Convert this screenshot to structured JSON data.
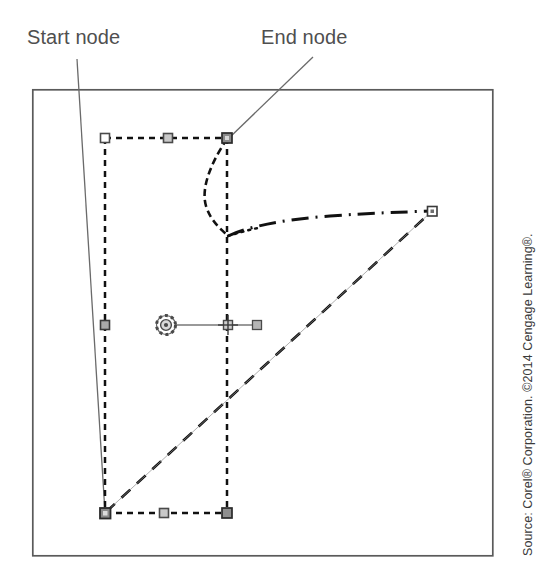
{
  "figure": {
    "canvas": {
      "width": 547,
      "height": 582,
      "background": "#ffffff"
    },
    "frame": {
      "name": "illustration-frame",
      "x": 32,
      "y": 89,
      "width": 461,
      "height": 467,
      "stroke": "#5a5a5a",
      "stroke_width": 1.6
    },
    "annotations": [
      {
        "id": "start-node",
        "label": "Start node",
        "label_x": 27,
        "label_y": 27,
        "leader": {
          "x1": 77,
          "y1": 59,
          "x2": 105,
          "y2": 513
        },
        "target": "bottom-left-node"
      },
      {
        "id": "end-node",
        "label": "End node",
        "label_x": 261,
        "label_y": 27,
        "leader": {
          "x1": 313,
          "y1": 57,
          "x2": 228,
          "y2": 139
        },
        "target": "top-right-node"
      }
    ],
    "shape": {
      "name": "selected-path",
      "bounding_box": {
        "x1": 105,
        "y1": 138,
        "x2": 227,
        "y2": 513
      },
      "stroke": "#111111",
      "dash_pattern": "6 5",
      "stroke_width": 2.4
    },
    "curve_segment": {
      "name": "bezier-curve-segment",
      "description": "dashed curve bulging left from top-right node down to mid-right",
      "stroke": "#111111"
    },
    "dashdot_segment": {
      "name": "dash-dot-curve-segment",
      "description": "dash-dot curve running right to the far node",
      "stroke": "#111111"
    },
    "diagonal_segment": {
      "name": "diagonal-dashed-segment",
      "description": "long dashed diagonal from bottom-left node to far right node",
      "stroke": "#111111"
    },
    "nodes": [
      {
        "id": "top-left-node",
        "x": 105,
        "y": 138,
        "type": "square",
        "size": 9
      },
      {
        "id": "top-mid-node",
        "x": 168,
        "y": 138,
        "type": "square",
        "size": 9
      },
      {
        "id": "top-right-node",
        "x": 227,
        "y": 138,
        "type": "square",
        "size": 10,
        "state": "selected"
      },
      {
        "id": "left-mid-node",
        "x": 105,
        "y": 325,
        "type": "square",
        "size": 9
      },
      {
        "id": "center-cross-node",
        "x": 228,
        "y": 325,
        "type": "cross",
        "size": 9
      },
      {
        "id": "bottom-left-node",
        "x": 105,
        "y": 513,
        "type": "square",
        "size": 10,
        "state": "selected"
      },
      {
        "id": "bottom-mid-node",
        "x": 164,
        "y": 513,
        "type": "square",
        "size": 9
      },
      {
        "id": "bottom-right-node",
        "x": 227,
        "y": 513,
        "type": "square",
        "size": 10
      },
      {
        "id": "far-right-node",
        "x": 432,
        "y": 211,
        "type": "square",
        "size": 9
      }
    ],
    "control_handle": {
      "name": "rotation-control-handle",
      "rosette": {
        "x": 166,
        "y": 325,
        "r": 9
      },
      "arm_start": {
        "x": 175,
        "y": 325
      },
      "arm_end": {
        "x": 257,
        "y": 325
      },
      "end_square": {
        "x": 257,
        "y": 325,
        "size": 8
      }
    }
  },
  "caption": {
    "source_text": "Source: Corel® Corporation. ©2014 Cengage Learning®."
  }
}
